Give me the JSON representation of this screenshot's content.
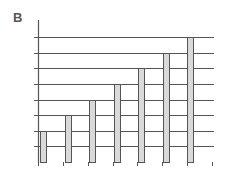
{
  "panel": {
    "label": "B"
  },
  "colors": {
    "grid": "#555555",
    "bar_fill": "#d9d9d9",
    "bar_stroke": "#555555",
    "axis": "#555555"
  },
  "chart_data": {
    "type": "bar",
    "title": "",
    "panel_label": "B",
    "xlabel": "",
    "ylabel": "",
    "categories": [
      "1",
      "2",
      "3",
      "4",
      "5",
      "6",
      "7"
    ],
    "values": [
      2,
      3,
      4,
      5,
      6,
      7,
      8
    ],
    "ylim": [
      0,
      8.5
    ],
    "grid": true,
    "gridlines": [
      1,
      2,
      3,
      4,
      5,
      6,
      7,
      8
    ],
    "tick_labels_visible": false,
    "legend": null
  }
}
